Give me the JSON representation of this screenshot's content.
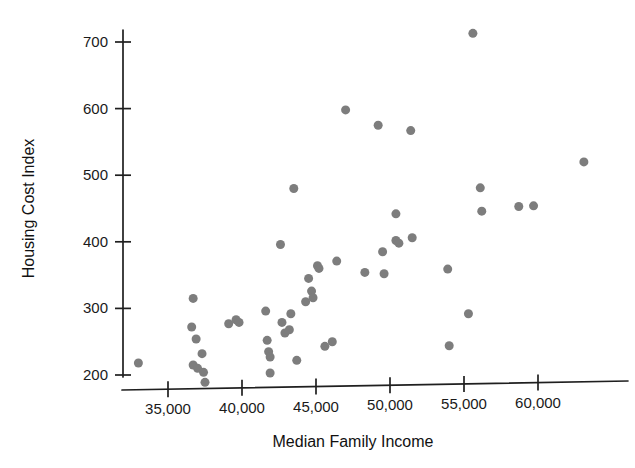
{
  "chart_data": {
    "type": "scatter",
    "title": "",
    "xlabel": "Median Family Income",
    "ylabel": "Housing Cost Index",
    "xlim": [
      32000,
      64500
    ],
    "ylim": [
      175,
      735
    ],
    "grid": false,
    "legend": null,
    "marker_color": "#7d7d7d",
    "marker_shape": "circle",
    "marker_size_px": 9,
    "xticks": [
      35000,
      40000,
      45000,
      50000,
      55000,
      60000
    ],
    "xticklabels": [
      "35,000",
      "40,000",
      "45,000",
      "50,000",
      "55,000",
      "60,000"
    ],
    "yticks": [
      200,
      300,
      400,
      500,
      600,
      700
    ],
    "yticklabels": [
      "200",
      "300",
      "400",
      "500",
      "600",
      "700"
    ],
    "points": [
      {
        "x": 33000,
        "y": 218
      },
      {
        "x": 36700,
        "y": 315
      },
      {
        "x": 36600,
        "y": 272
      },
      {
        "x": 36900,
        "y": 254
      },
      {
        "x": 36700,
        "y": 215
      },
      {
        "x": 37000,
        "y": 210
      },
      {
        "x": 37300,
        "y": 232
      },
      {
        "x": 37400,
        "y": 204
      },
      {
        "x": 37500,
        "y": 189
      },
      {
        "x": 39100,
        "y": 277
      },
      {
        "x": 39600,
        "y": 283
      },
      {
        "x": 39800,
        "y": 279
      },
      {
        "x": 41600,
        "y": 296
      },
      {
        "x": 41700,
        "y": 252
      },
      {
        "x": 41800,
        "y": 235
      },
      {
        "x": 41900,
        "y": 227
      },
      {
        "x": 41900,
        "y": 203
      },
      {
        "x": 42600,
        "y": 396
      },
      {
        "x": 42700,
        "y": 279
      },
      {
        "x": 42900,
        "y": 263
      },
      {
        "x": 43200,
        "y": 268
      },
      {
        "x": 43300,
        "y": 292
      },
      {
        "x": 43500,
        "y": 480
      },
      {
        "x": 43700,
        "y": 222
      },
      {
        "x": 44300,
        "y": 310
      },
      {
        "x": 44500,
        "y": 345
      },
      {
        "x": 44700,
        "y": 326
      },
      {
        "x": 44800,
        "y": 316
      },
      {
        "x": 45100,
        "y": 364
      },
      {
        "x": 45200,
        "y": 360
      },
      {
        "x": 45600,
        "y": 243
      },
      {
        "x": 46100,
        "y": 250
      },
      {
        "x": 46400,
        "y": 371
      },
      {
        "x": 47000,
        "y": 598
      },
      {
        "x": 48300,
        "y": 354
      },
      {
        "x": 49200,
        "y": 575
      },
      {
        "x": 49500,
        "y": 385
      },
      {
        "x": 49600,
        "y": 352
      },
      {
        "x": 50400,
        "y": 442
      },
      {
        "x": 50400,
        "y": 402
      },
      {
        "x": 50600,
        "y": 398
      },
      {
        "x": 51400,
        "y": 567
      },
      {
        "x": 51500,
        "y": 406
      },
      {
        "x": 53900,
        "y": 359
      },
      {
        "x": 54000,
        "y": 244
      },
      {
        "x": 55300,
        "y": 292
      },
      {
        "x": 55600,
        "y": 713
      },
      {
        "x": 56100,
        "y": 481
      },
      {
        "x": 56200,
        "y": 446
      },
      {
        "x": 58700,
        "y": 453
      },
      {
        "x": 59700,
        "y": 454
      },
      {
        "x": 63100,
        "y": 520
      }
    ]
  }
}
